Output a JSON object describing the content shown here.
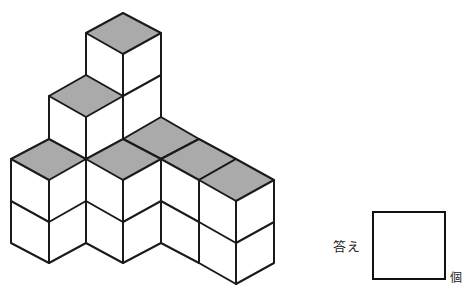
{
  "problem": {
    "type": "count-the-cubes",
    "answer_label": "答え",
    "unit_label": "個",
    "answer_value": ""
  },
  "colors": {
    "top_face": "#aaaaaa",
    "side_face": "#ffffff",
    "edge": "#1a1a1a"
  },
  "figure": {
    "top_faces": [
      [
        [
          123,
          13
        ],
        [
          161,
          33
        ],
        [
          123,
          54
        ],
        [
          86,
          33
        ]
      ],
      [
        [
          86,
          75
        ],
        [
          123,
          96
        ],
        [
          86,
          117
        ],
        [
          49,
          96
        ]
      ],
      [
        [
          49,
          139
        ],
        [
          86,
          159
        ],
        [
          49,
          180
        ],
        [
          11,
          159
        ]
      ],
      [
        [
          161,
          117
        ],
        [
          199,
          139
        ],
        [
          161,
          159
        ],
        [
          123,
          139
        ]
      ],
      [
        [
          123,
          139
        ],
        [
          161,
          159
        ],
        [
          123,
          180
        ],
        [
          86,
          159
        ]
      ],
      [
        [
          199,
          139
        ],
        [
          236,
          159
        ],
        [
          199,
          180
        ],
        [
          161,
          159
        ]
      ],
      [
        [
          236,
          159
        ],
        [
          274,
          180
        ],
        [
          236,
          201
        ],
        [
          199,
          180
        ]
      ]
    ]
  }
}
